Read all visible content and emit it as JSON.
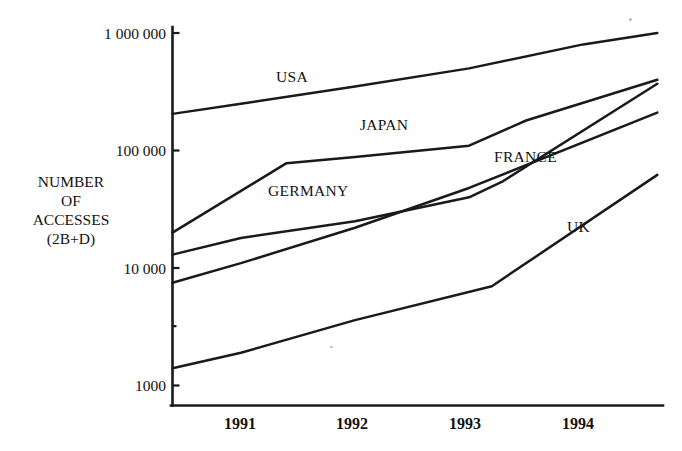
{
  "chart_data": {
    "type": "line",
    "title": "",
    "xlabel": "",
    "ylabel": "NUMBER OF ACCESSES (2B+D)",
    "scale": "log",
    "x_ticks": [
      "1991",
      "1992",
      "1993",
      "1994"
    ],
    "x_tick_values": [
      1991,
      1992,
      1993,
      1994
    ],
    "xlim": [
      1990.4,
      1994.7
    ],
    "y_ticks": [
      "1000",
      "10 000",
      "100 000",
      "1 000 000"
    ],
    "y_tick_values": [
      1000,
      10000,
      100000,
      1000000
    ],
    "ylim": [
      1000,
      1000000
    ],
    "grid": false,
    "legend_position": "inline-labels",
    "series": [
      {
        "name": "USA",
        "label": "USA",
        "x": [
          1990.4,
          1991.0,
          1992.0,
          1993.0,
          1994.0,
          1994.65
        ],
        "values": [
          205000,
          250000,
          350000,
          500000,
          800000,
          1000000
        ]
      },
      {
        "name": "JAPAN",
        "label": "JAPAN",
        "x": [
          1990.4,
          1991.4,
          1992.0,
          1993.0,
          1993.5,
          1994.65
        ],
        "values": [
          20000,
          78000,
          88000,
          110000,
          180000,
          400000
        ]
      },
      {
        "name": "GERMANY",
        "label": "GERMANY",
        "x": [
          1990.4,
          1991.0,
          1992.0,
          1993.0,
          1993.3,
          1994.65
        ],
        "values": [
          13000,
          18000,
          25000,
          40000,
          55000,
          370000
        ]
      },
      {
        "name": "FRANCE",
        "label": "FRANCE",
        "x": [
          1990.4,
          1991.0,
          1992.0,
          1993.0,
          1994.65
        ],
        "values": [
          7500,
          11000,
          22000,
          48000,
          210000
        ]
      },
      {
        "name": "UK",
        "label": "UK",
        "x": [
          1990.4,
          1991.0,
          1992.0,
          1993.2,
          1994.65
        ],
        "values": [
          1400,
          1900,
          3600,
          7000,
          62000
        ]
      }
    ],
    "series_label_text": {
      "usa": "USA",
      "japan": "JAPAN",
      "germany": "GERMANY",
      "france": "FRANCE",
      "uk": "UK"
    },
    "y_axis_title_lines": [
      "NUMBER",
      "OF",
      "ACCESSES",
      "(2B+D)"
    ],
    "colors": {
      "line": "#1a1a1a",
      "axis": "#1a1a1a",
      "background": "#ffffff",
      "text": "#121212"
    }
  }
}
